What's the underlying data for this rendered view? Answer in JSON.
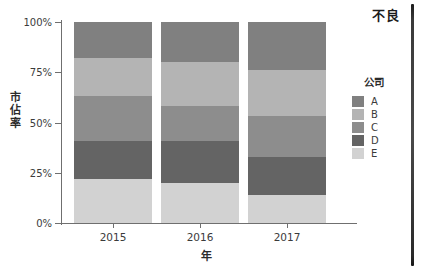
{
  "annotation": {
    "corner_label": "不良"
  },
  "chart_data": {
    "type": "bar",
    "stacked": true,
    "stack_mode": "percent",
    "title": "",
    "subtitle": "",
    "xlabel": "年",
    "ylabel": "市佔率",
    "categories": [
      "2015",
      "2016",
      "2017"
    ],
    "x_tick_labels": [
      "2015",
      "2016",
      "2017"
    ],
    "y_tick_labels": [
      "0%",
      "25%",
      "50%",
      "75%",
      "100%"
    ],
    "y_tick_values": [
      0,
      25,
      50,
      75,
      100
    ],
    "ylim": [
      0,
      100
    ],
    "grid": false,
    "legend_position": "right",
    "legend_title": "公司",
    "series": [
      {
        "name": "A",
        "color": "#808080",
        "values": [
          18,
          20,
          24
        ]
      },
      {
        "name": "B",
        "color": "#b4b4b4",
        "values": [
          19,
          22,
          23
        ]
      },
      {
        "name": "C",
        "color": "#8d8d8d",
        "values": [
          22,
          17,
          20
        ]
      },
      {
        "name": "D",
        "color": "#646464",
        "values": [
          19,
          21,
          19
        ]
      },
      {
        "name": "E",
        "color": "#d2d2d2",
        "values": [
          22,
          20,
          14
        ]
      }
    ],
    "stack_order_top_to_bottom": [
      "A",
      "B",
      "C",
      "D",
      "E"
    ]
  },
  "legend": {
    "title": "公司",
    "items": [
      {
        "label": "A",
        "color": "#808080"
      },
      {
        "label": "B",
        "color": "#b4b4b4"
      },
      {
        "label": "C",
        "color": "#8d8d8d"
      },
      {
        "label": "D",
        "color": "#646464"
      },
      {
        "label": "E",
        "color": "#d2d2d2"
      }
    ]
  },
  "colors": {
    "axis": "#6f6f6f",
    "text": "#3b3b3b",
    "background": "#ffffff",
    "rail": "#2a2a2a"
  }
}
